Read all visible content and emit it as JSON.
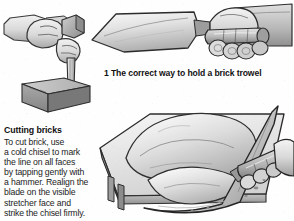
{
  "page": {
    "background_color": "#fefefe",
    "ink_color": "#1a1a1a"
  },
  "figures": [
    {
      "id": "hammer-chisel-brick",
      "name": "hammer-and-chisel-on-brick-illustration",
      "description": "A hand holding a hammer striking a cold chisel held vertically against a brick",
      "position": "top-left"
    },
    {
      "id": "hand-holding-trowel",
      "name": "hand-holding-brick-trowel-illustration",
      "description": "A hand gripping a brick trowel with the blade pointing left",
      "position": "top-right"
    },
    {
      "id": "trowel-mortar-board",
      "name": "trowel-loading-mortar-illustration",
      "description": "A trowel lifting mortar from a pile on a mortar board with legs",
      "position": "bottom-right"
    }
  ],
  "captions": {
    "trowel_caption": "1 The correct way to hold a brick trowel"
  },
  "sidebar_text": {
    "heading": "Cutting bricks",
    "lines": [
      "To cut brick, use",
      "a cold chisel to mark",
      "the line on all faces",
      "by tapping gently with",
      "a hammer. Realign the",
      "blade on the visible",
      "stretcher face and",
      "strike the chisel firmly."
    ]
  },
  "palette": {
    "ink": "#2a2a2a",
    "light_gray": "#e8e8e8",
    "mid_gray": "#b9b9b9",
    "dark_gray": "#8a8a8a",
    "shadow_gray": "#6e6e6e",
    "paper": "#fefefe"
  }
}
